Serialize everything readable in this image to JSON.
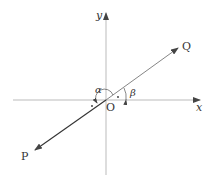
{
  "diagram": {
    "axes": {
      "x_label": "x",
      "y_label": "y",
      "origin_label": "O"
    },
    "points": {
      "P": "P",
      "Q": "Q"
    },
    "angles": {
      "alpha": "α",
      "beta": "β"
    },
    "colors": {
      "axis": "#999999",
      "line": "#444444",
      "text": "#333333"
    }
  }
}
